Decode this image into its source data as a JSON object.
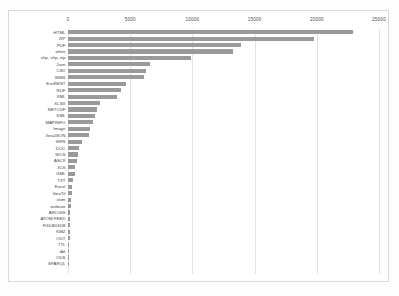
{
  "chart_data": {
    "type": "bar",
    "orientation": "horizontal",
    "title": "",
    "xlabel": "",
    "ylabel": "",
    "xlim": [
      0,
      25000
    ],
    "xticks": [
      0,
      5000,
      10000,
      15000,
      20000,
      25000
    ],
    "xticklabels": [
      "0",
      "5000",
      "10000",
      "15000",
      "20000",
      "25000"
    ],
    "grid": true,
    "axis_position": "top",
    "legend": "none",
    "bar_color": "#9a9a9a",
    "categories": [
      "HTML",
      "ZIP",
      "PDF",
      "other",
      "shp, shp, zip",
      "Json",
      "CSV",
      "WMS",
      "EsriREST",
      "RDF",
      "XML",
      "XLSX",
      "NETCDF",
      "KML",
      "MAPINFO",
      "Image",
      "GeoJSON",
      "WFS",
      "DOC",
      "WCS",
      "ASCII",
      "XLS",
      "GML",
      "TXT",
      "Excel",
      "GeoTif",
      "xlsm",
      "website",
      "ARCGIS",
      "ATOM FEED",
      "FGDB/GDB",
      "KMZ",
      "ODT",
      "TTL",
      "dbf",
      "ODS",
      "SPARQL"
    ],
    "values": [
      22900,
      19800,
      13900,
      13300,
      9900,
      6600,
      6300,
      6100,
      4700,
      4300,
      3900,
      2600,
      2300,
      2200,
      2000,
      1800,
      1700,
      1100,
      900,
      800,
      700,
      600,
      550,
      400,
      330,
      300,
      260,
      230,
      200,
      180,
      160,
      150,
      130,
      110,
      100,
      90,
      80
    ]
  }
}
